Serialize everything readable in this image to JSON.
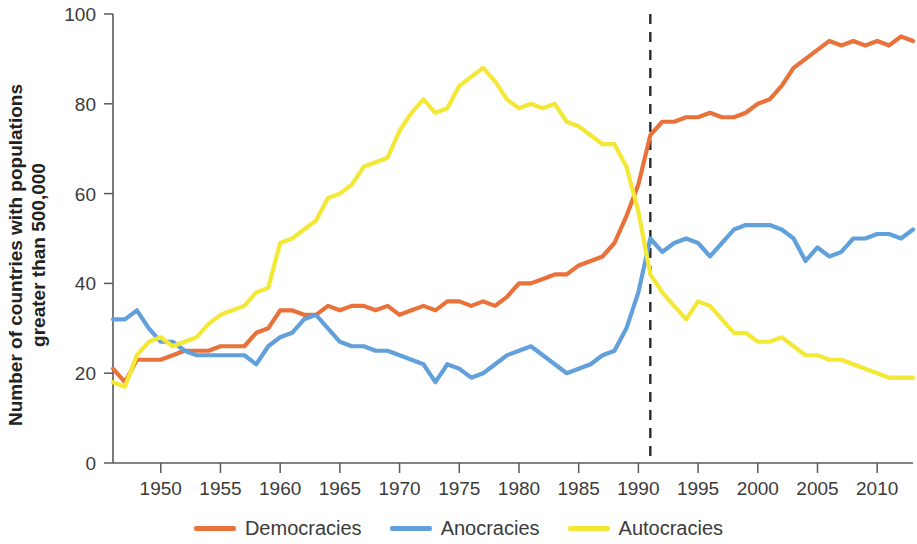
{
  "axes": {
    "ylabel_line1": "Number of countries with populations",
    "ylabel_line2": "greater than 500,000",
    "xlabel": "",
    "y_ticks": [
      "0",
      "20",
      "40",
      "60",
      "80",
      "100"
    ],
    "x_ticks": [
      "1950",
      "1955",
      "1960",
      "1965",
      "1970",
      "1975",
      "1980",
      "1985",
      "1990",
      "1995",
      "2000",
      "2005",
      "2010"
    ]
  },
  "legend": {
    "items": [
      {
        "label": "Democracies",
        "color": "#E8723A"
      },
      {
        "label": "Anocracies",
        "color": "#62A0DC"
      },
      {
        "label": "Autocracies",
        "color": "#F4E836"
      }
    ]
  },
  "annotations": {
    "event_line_year": 1991,
    "event_line_color": "#2b2b2b"
  },
  "chart_data": {
    "type": "line",
    "title": "",
    "xlabel": "",
    "ylabel": "Number of countries with populations greater than 500,000",
    "xlim": [
      1946,
      2013
    ],
    "ylim": [
      0,
      100
    ],
    "y_ticks": [
      0,
      20,
      40,
      60,
      80,
      100
    ],
    "x_ticks": [
      1950,
      1955,
      1960,
      1965,
      1970,
      1975,
      1980,
      1985,
      1990,
      1995,
      2000,
      2005,
      2010
    ],
    "grid": false,
    "legend_position": "bottom",
    "annotations": [
      {
        "type": "vline",
        "x": 1991,
        "style": "dashed",
        "color": "#2b2b2b"
      }
    ],
    "x": [
      1946,
      1947,
      1948,
      1949,
      1950,
      1951,
      1952,
      1953,
      1954,
      1955,
      1956,
      1957,
      1958,
      1959,
      1960,
      1961,
      1962,
      1963,
      1964,
      1965,
      1966,
      1967,
      1968,
      1969,
      1970,
      1971,
      1972,
      1973,
      1974,
      1975,
      1976,
      1977,
      1978,
      1979,
      1980,
      1981,
      1982,
      1983,
      1984,
      1985,
      1986,
      1987,
      1988,
      1989,
      1990,
      1991,
      1992,
      1993,
      1994,
      1995,
      1996,
      1997,
      1998,
      1999,
      2000,
      2001,
      2002,
      2003,
      2004,
      2005,
      2006,
      2007,
      2008,
      2009,
      2010,
      2011,
      2012,
      2013
    ],
    "series": [
      {
        "name": "Democracies",
        "color": "#E8723A",
        "values": [
          21,
          18,
          23,
          23,
          23,
          24,
          25,
          25,
          25,
          26,
          26,
          26,
          29,
          30,
          34,
          34,
          33,
          33,
          35,
          34,
          35,
          35,
          34,
          35,
          33,
          34,
          35,
          34,
          36,
          36,
          35,
          36,
          35,
          37,
          40,
          40,
          41,
          42,
          42,
          44,
          45,
          46,
          49,
          55,
          62,
          73,
          76,
          76,
          77,
          77,
          78,
          77,
          77,
          78,
          80,
          81,
          84,
          88,
          90,
          92,
          94,
          93,
          94,
          93,
          94,
          93,
          95,
          94
        ]
      },
      {
        "name": "Anocracies",
        "color": "#62A0DC",
        "values": [
          32,
          32,
          34,
          30,
          27,
          27,
          25,
          24,
          24,
          24,
          24,
          24,
          22,
          26,
          28,
          29,
          32,
          33,
          30,
          27,
          26,
          26,
          25,
          25,
          24,
          23,
          22,
          18,
          22,
          21,
          19,
          20,
          22,
          24,
          25,
          26,
          24,
          22,
          20,
          21,
          22,
          24,
          25,
          30,
          38,
          50,
          47,
          49,
          50,
          49,
          46,
          49,
          52,
          53,
          53,
          53,
          52,
          50,
          45,
          48,
          46,
          47,
          50,
          50,
          51,
          51,
          50,
          52
        ]
      },
      {
        "name": "Autocracies",
        "color": "#F4E836",
        "values": [
          18,
          17,
          24,
          27,
          28,
          26,
          27,
          28,
          31,
          33,
          34,
          35,
          38,
          39,
          49,
          50,
          52,
          54,
          59,
          60,
          62,
          66,
          67,
          68,
          74,
          78,
          81,
          78,
          79,
          84,
          86,
          88,
          85,
          81,
          79,
          80,
          79,
          80,
          76,
          75,
          73,
          71,
          71,
          66,
          56,
          42,
          38,
          35,
          32,
          36,
          35,
          32,
          29,
          29,
          27,
          27,
          28,
          26,
          24,
          24,
          23,
          23,
          22,
          21,
          20,
          19,
          19,
          19
        ]
      }
    ]
  }
}
